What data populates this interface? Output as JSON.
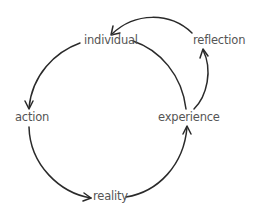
{
  "diagram": {
    "type": "cycle",
    "nodes": [
      {
        "id": "individual",
        "label": "individual"
      },
      {
        "id": "reflection",
        "label": "reflection"
      },
      {
        "id": "action",
        "label": "action"
      },
      {
        "id": "experience",
        "label": "experience"
      },
      {
        "id": "reality",
        "label": "reality"
      }
    ],
    "edges": [
      {
        "from": "individual",
        "to": "action"
      },
      {
        "from": "action",
        "to": "reality"
      },
      {
        "from": "reality",
        "to": "experience"
      },
      {
        "from": "individual",
        "to": "experience"
      },
      {
        "from": "experience",
        "to": "reflection"
      },
      {
        "from": "reflection",
        "to": "individual"
      }
    ],
    "colors": {
      "stroke": "#2a2a2a",
      "text": "#555555",
      "background": "#ffffff"
    }
  }
}
